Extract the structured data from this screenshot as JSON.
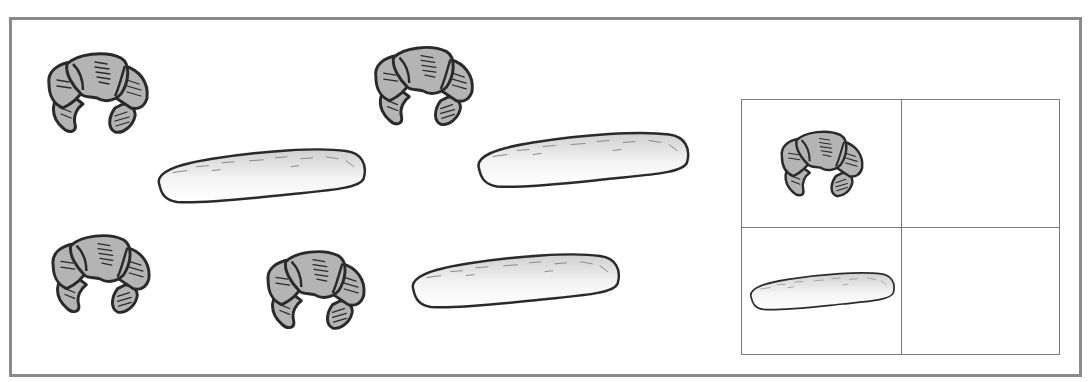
{
  "worksheet": {
    "title": "",
    "colors": {
      "frame": "#8a8a8a",
      "grid_line": "#7a7a7a",
      "croissant_fill": "#b4b4b4",
      "outline": "#2a2a2a",
      "baguette_fill_top": "#d8d8d8",
      "baguette_fill_bottom": "#ffffff"
    },
    "scene_items": [
      {
        "type": "croissant",
        "x": 43,
        "y": 50,
        "w": 110,
        "h": 84
      },
      {
        "type": "croissant",
        "x": 370,
        "y": 43,
        "w": 108,
        "h": 84
      },
      {
        "type": "croissant",
        "x": 47,
        "y": 232,
        "w": 108,
        "h": 82
      },
      {
        "type": "croissant",
        "x": 262,
        "y": 248,
        "w": 108,
        "h": 82
      },
      {
        "type": "baguette",
        "x": 152,
        "y": 147,
        "w": 217,
        "h": 57
      },
      {
        "type": "baguette",
        "x": 473,
        "y": 130,
        "w": 218,
        "h": 59
      },
      {
        "type": "baguette",
        "x": 406,
        "y": 252,
        "w": 217,
        "h": 57
      }
    ],
    "tally_grid": {
      "rows": 2,
      "cols": 2,
      "cells": [
        {
          "row": 0,
          "col": 0,
          "icon": "croissant",
          "value": ""
        },
        {
          "row": 0,
          "col": 1,
          "icon": "",
          "value": ""
        },
        {
          "row": 1,
          "col": 0,
          "icon": "baguette",
          "value": ""
        },
        {
          "row": 1,
          "col": 1,
          "icon": "",
          "value": ""
        }
      ]
    },
    "counts_visible": {
      "croissant": 4,
      "baguette": 3
    }
  }
}
